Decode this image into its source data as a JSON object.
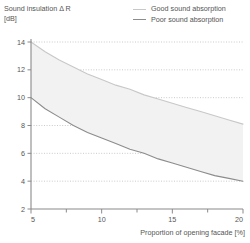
{
  "chart_data": {
    "type": "line",
    "title": "Sound insulation Δ R",
    "ylabel": "Sound insulation Δ R",
    "yunit": "[dB]",
    "xlabel": "Proportion of opening facade [%]",
    "xlim": [
      5,
      20
    ],
    "ylim": [
      2,
      14
    ],
    "xticks": [
      5,
      10,
      15,
      20
    ],
    "xtick_labels": [
      "5",
      "10",
      "15",
      "20"
    ],
    "xminor_ticks": [
      7.5,
      12.5,
      17.5
    ],
    "yticks": [
      2,
      4,
      6,
      8,
      10,
      12,
      14
    ],
    "ytick_labels": [
      "2",
      "4",
      "6",
      "8",
      "10",
      "12",
      "14"
    ],
    "grid": "horizontal-dotted",
    "legend_position": "top-right",
    "band_fill": "#f2f2f2",
    "series": [
      {
        "name": "Good sound absorption",
        "color": "#c8c8c8",
        "x": [
          5,
          6,
          7,
          8,
          9,
          10,
          11,
          12,
          13,
          14,
          15,
          16,
          17,
          18,
          19,
          20
        ],
        "values": [
          14.0,
          13.3,
          12.7,
          12.2,
          11.7,
          11.3,
          10.9,
          10.6,
          10.2,
          9.9,
          9.6,
          9.3,
          9.0,
          8.7,
          8.4,
          8.1
        ]
      },
      {
        "name": "Poor sound absorption",
        "color": "#8c8c8c",
        "x": [
          5,
          6,
          7,
          8,
          9,
          10,
          11,
          12,
          13,
          14,
          15,
          16,
          17,
          18,
          19,
          20
        ],
        "values": [
          10.0,
          9.2,
          8.6,
          8.0,
          7.5,
          7.1,
          6.7,
          6.3,
          6.0,
          5.6,
          5.3,
          5.0,
          4.7,
          4.4,
          4.2,
          4.0
        ]
      }
    ]
  },
  "axis": {
    "y_title_line1": "Sound insulation Δ R",
    "y_title_line2": "[dB]",
    "x_title": "Proportion of opening facade [%]"
  },
  "legend": {
    "items": [
      {
        "label": "Good sound absorption",
        "color": "#c8c8c8"
      },
      {
        "label": "Poor sound absorption",
        "color": "#8c8c8c"
      }
    ]
  }
}
